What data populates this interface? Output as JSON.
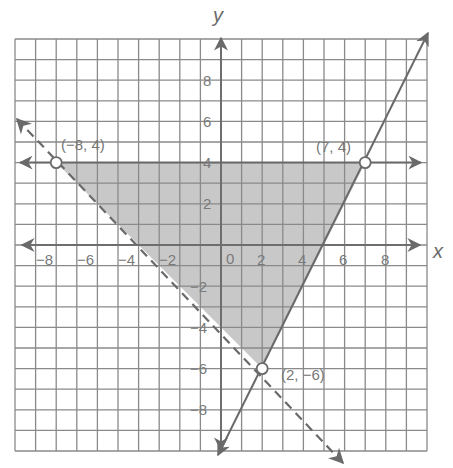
{
  "chart_data": {
    "type": "line",
    "title": "",
    "xlabel": "x",
    "ylabel": "y",
    "xlim": [
      -10,
      10
    ],
    "ylim": [
      -10,
      10
    ],
    "grid": true,
    "x_ticks": [
      "−8",
      "−6",
      "−4",
      "−2",
      "0",
      "2",
      "4",
      "6",
      "8"
    ],
    "y_ticks": [
      "8",
      "6",
      "4",
      "2",
      "−2",
      "−4",
      "−6",
      "−8"
    ],
    "series": [
      {
        "name": "y = 4",
        "style": "solid",
        "points": [
          [
            -10,
            4
          ],
          [
            10,
            4
          ]
        ]
      },
      {
        "name": "y = 2x - 10",
        "style": "solid",
        "points": [
          [
            0,
            -10
          ],
          [
            10,
            10
          ]
        ]
      },
      {
        "name": "y = -x - 4",
        "style": "dashed",
        "points": [
          [
            -10,
            6
          ],
          [
            6,
            -10
          ]
        ]
      }
    ],
    "shaded_region": {
      "vertices": [
        [
          -8,
          4
        ],
        [
          7,
          4
        ],
        [
          2,
          -6
        ]
      ],
      "color": "#c8c8c8"
    },
    "annotations": [
      {
        "label": "(−8, 4)",
        "x": -8,
        "y": 4,
        "marker": "open-circle"
      },
      {
        "label": "(7, 4)",
        "x": 7,
        "y": 4,
        "marker": "open-circle"
      },
      {
        "label": "(2, −6)",
        "x": 2,
        "y": -6,
        "marker": "open-circle"
      }
    ]
  },
  "labels": {
    "x_axis": "x",
    "y_axis": "y",
    "pt1": "(−8, 4)",
    "pt2": "(7, 4)",
    "pt3": "(2, −6)",
    "xt": [
      "−8",
      "−6",
      "−4",
      "−2",
      "0",
      "2",
      "4",
      "6",
      "8"
    ],
    "yt": [
      "8",
      "6",
      "4",
      "2",
      "−2",
      "−4",
      "−6",
      "−8"
    ]
  },
  "colors": {
    "grid": "#8a8a8a",
    "axis": "#6e6e6e",
    "line": "#6a6a6a",
    "fill": "#c8c8c8"
  }
}
